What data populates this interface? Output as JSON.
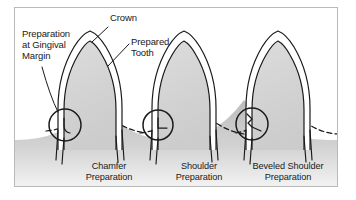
{
  "figure": {
    "frame_color": "#b9b9b9",
    "background_color": "#ffffff",
    "ink_color": "#1a1a1a",
    "tooth_fill": "#d4d4d4",
    "gum_fill": "#c9c9c9",
    "crown_fill": "#ffffff"
  },
  "annotations": [
    {
      "id": "crown",
      "name": "crown",
      "lines": [
        "Crown"
      ],
      "x": 110,
      "y": 14,
      "align": "left"
    },
    {
      "id": "preparation-at-gingival-margin",
      "name": "preparation-at-gingival-margin",
      "lines": [
        "Preparation",
        "at Gingival",
        "Margin"
      ],
      "x": 22,
      "y": 30,
      "align": "left"
    },
    {
      "id": "prepared-tooth",
      "name": "prepared-tooth",
      "lines": [
        "Prepared",
        "Tooth"
      ],
      "x": 131,
      "y": 38,
      "align": "left"
    }
  ],
  "specimens": [
    {
      "id": "chamfer",
      "name": "chamfer-preparation",
      "caption": [
        "Chamfer",
        "Preparation"
      ],
      "caption_x": 109,
      "caption_y": 162,
      "margin_type": "chamfer",
      "detail_circle": {
        "cx": 65,
        "cy": 125,
        "r": 16
      }
    },
    {
      "id": "shoulder",
      "name": "shoulder-preparation",
      "caption": [
        "Shoulder",
        "Preparation"
      ],
      "caption_x": 199,
      "caption_y": 162,
      "margin_type": "shoulder",
      "detail_circle": {
        "cx": 158,
        "cy": 125,
        "r": 15
      }
    },
    {
      "id": "beveled-shoulder",
      "name": "beveled-shoulder-preparation",
      "caption": [
        "Beveled Shoulder",
        "Preparation"
      ],
      "caption_x": 288,
      "caption_y": 162,
      "margin_type": "beveled-shoulder",
      "detail_circle": {
        "cx": 252,
        "cy": 124,
        "r": 16
      }
    }
  ]
}
